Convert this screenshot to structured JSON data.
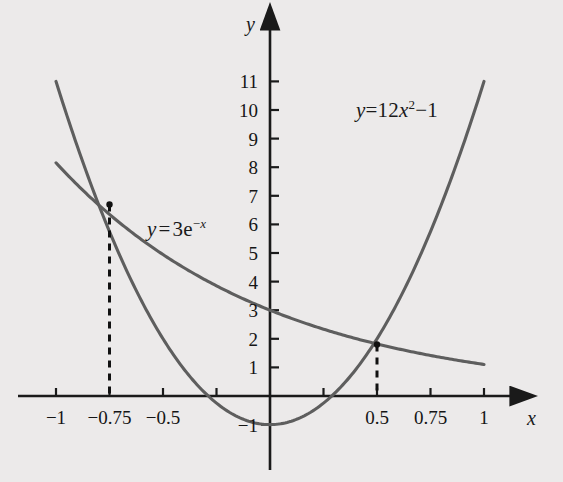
{
  "figure": {
    "background_color": "#eceaea",
    "curve_color": "#5e5e5e",
    "axis_color": "#1a1a1a",
    "x_axis_name": "x",
    "y_axis_name": "y"
  },
  "chart_data": {
    "type": "line",
    "title": "",
    "xlabel": "x",
    "ylabel": "y",
    "xlim": [
      -1.08,
      1.12
    ],
    "ylim": [
      -1.55,
      11.9
    ],
    "grid": false,
    "legend": "inline-labels",
    "x_ticks": [
      -1,
      -0.75,
      -0.5,
      -0.25,
      0.25,
      0.5,
      0.75,
      1
    ],
    "x_tick_labels": [
      "−1",
      "−0.75",
      "−0.5",
      "",
      "",
      "0.5",
      "0.75",
      "1"
    ],
    "y_ticks": [
      -1,
      1,
      2,
      3,
      4,
      5,
      6,
      7,
      8,
      9,
      10,
      11
    ],
    "y_tick_labels": [
      "−1",
      "1",
      "2",
      "3",
      "4",
      "5",
      "6",
      "7",
      "8",
      "9",
      "10",
      "11"
    ],
    "series": [
      {
        "name": "parabola",
        "equation_text": "y=12x²−1",
        "equation_parts": {
          "lhs": "y",
          "eq": "=",
          "coef": "12",
          "var": "x",
          "power": "2",
          "op": "−",
          "const": "1"
        },
        "formula": "y = 12*x^2 - 1",
        "x_start": -1.0,
        "x_end": 1.0,
        "sample_points": [
          {
            "x": -1.0,
            "y": 11.0
          },
          {
            "x": -0.75,
            "y": 5.75
          },
          {
            "x": -0.5,
            "y": 2.0
          },
          {
            "x": -0.25,
            "y": -0.25
          },
          {
            "x": 0.0,
            "y": -1.0
          },
          {
            "x": 0.25,
            "y": -0.25
          },
          {
            "x": 0.5,
            "y": 2.0
          },
          {
            "x": 0.75,
            "y": 5.75
          },
          {
            "x": 1.0,
            "y": 11.0
          }
        ],
        "label_position": {
          "x": 0.52,
          "y": 10.2
        }
      },
      {
        "name": "exponential",
        "equation_text": "y = 3e−x",
        "equation_parts": {
          "lhs": "y",
          "eq": "=",
          "coef": "3",
          "base": "e",
          "exp_sign": "−",
          "exp_var": "x"
        },
        "formula": "y = 3*e^(-x)",
        "x_start": -1.0,
        "x_end": 1.0,
        "sample_points": [
          {
            "x": -1.0,
            "y": 8.155
          },
          {
            "x": -0.75,
            "y": 6.352
          },
          {
            "x": -0.5,
            "y": 4.946
          },
          {
            "x": -0.25,
            "y": 3.852
          },
          {
            "x": 0.0,
            "y": 3.0
          },
          {
            "x": 0.25,
            "y": 2.336
          },
          {
            "x": 0.5,
            "y": 1.82
          },
          {
            "x": 0.75,
            "y": 1.417
          },
          {
            "x": 1.0,
            "y": 1.104
          }
        ],
        "label_position": {
          "x": -0.58,
          "y": 6.4
        }
      }
    ],
    "intersections": [
      {
        "x": -0.75,
        "y": 6.7,
        "marker": "dot",
        "dropline": "dashed"
      },
      {
        "x": 0.5,
        "y": 1.8,
        "marker": "dot",
        "dropline": "dashed"
      }
    ],
    "annotations": [
      {
        "name": "parabola-equation",
        "text": "y=12x²−1"
      },
      {
        "name": "exponential-equation",
        "text": "y = 3e−x"
      }
    ]
  },
  "x_axis_labels": [
    {
      "value": -1,
      "text": "−1"
    },
    {
      "value": -0.75,
      "text": "−0.75"
    },
    {
      "value": -0.5,
      "text": "−0.5"
    },
    {
      "value": 0.5,
      "text": "0.5"
    },
    {
      "value": 0.75,
      "text": "0.75"
    },
    {
      "value": 1,
      "text": "1"
    }
  ],
  "y_axis_labels": [
    {
      "value": 11,
      "text": "11"
    },
    {
      "value": 10,
      "text": "10"
    },
    {
      "value": 9,
      "text": "9"
    },
    {
      "value": 8,
      "text": "8"
    },
    {
      "value": 7,
      "text": "7"
    },
    {
      "value": 6,
      "text": "6"
    },
    {
      "value": 5,
      "text": "5"
    },
    {
      "value": 4,
      "text": "4"
    },
    {
      "value": 3,
      "text": "3"
    },
    {
      "value": 2,
      "text": "2"
    },
    {
      "value": 1,
      "text": "1"
    },
    {
      "value": -1,
      "text": "−1"
    }
  ]
}
